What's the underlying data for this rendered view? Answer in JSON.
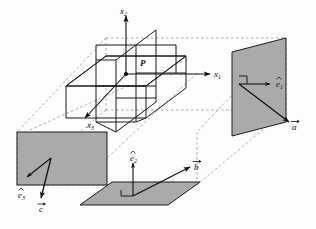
{
  "figure": {
    "type": "vector-diagram",
    "background_color": "#fdfdfd",
    "plane_fill_color": "#aaaaaa",
    "plane_stroke_color": "#1a1a1a",
    "line_color": "#1a1a1a",
    "dashed_color": "#7a7a7a"
  },
  "labels": {
    "axis_x1": {
      "base": "x",
      "sub": "1"
    },
    "axis_x2": {
      "base": "x",
      "sub": "2"
    },
    "axis_x3": {
      "base": "x",
      "sub": "3"
    },
    "point_p": "P",
    "unit_e1": {
      "base": "e",
      "sub": "1",
      "accent": "hat"
    },
    "unit_e2": {
      "base": "e",
      "sub": "2",
      "accent": "hat"
    },
    "unit_e3": {
      "base": "e",
      "sub": "3",
      "accent": "hat"
    },
    "vector_a": {
      "base": "a",
      "accent": "arrow"
    },
    "vector_b": {
      "base": "b",
      "accent": "arrow"
    },
    "vector_c": {
      "base": "c",
      "accent": "arrow"
    }
  },
  "elements": {
    "right_plane_name": "right-projection-plane",
    "left_plane_name": "left-projection-plane",
    "bottom_plane_name": "bottom-projection-plane",
    "center_frame_name": "central-coordinate-planes",
    "bounding_box_name": "dashed-bounding-box"
  }
}
